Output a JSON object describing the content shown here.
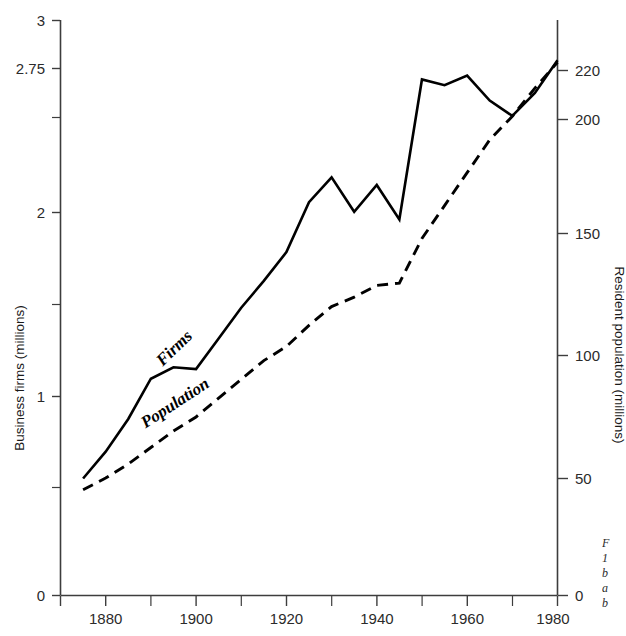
{
  "chart_data": {
    "type": "line",
    "title": "",
    "subtitle": "",
    "xlabel": "",
    "ylabel": "Business firms (millions)",
    "y2label": "Resident population (millions)",
    "grid": false,
    "legend_position": "inline-on-curve",
    "xlim": [
      1870,
      1980
    ],
    "ylim": [
      0,
      3
    ],
    "y2lim": [
      0,
      245
    ],
    "x_ticks_major": [
      1880,
      1900,
      1920,
      1940,
      1960,
      1980
    ],
    "x_ticks_minor": [
      1890,
      1910,
      1930,
      1950,
      1970
    ],
    "y_ticks_major": [
      0,
      1,
      2,
      2.75,
      3
    ],
    "y_tick_labels": [
      "0",
      "1",
      "2",
      "2.75",
      "3"
    ],
    "y_ticks_minor": [
      0.5,
      1.5
    ],
    "y2_ticks": [
      0,
      50,
      100,
      150,
      200,
      220
    ],
    "y2_tick_labels": [
      "0",
      "50",
      "100",
      "150",
      "200",
      "220"
    ],
    "x": [
      1875,
      1880,
      1885,
      1890,
      1895,
      1900,
      1905,
      1910,
      1915,
      1920,
      1925,
      1930,
      1935,
      1940,
      1945,
      1950,
      1955,
      1960,
      1965,
      1970,
      1975,
      1980
    ],
    "series": [
      {
        "name": "Firms",
        "axis": "left",
        "style": "solid",
        "units": "millions of business firms",
        "values": [
          0.61,
          0.75,
          0.92,
          1.13,
          1.19,
          1.18,
          1.34,
          1.5,
          1.64,
          1.79,
          2.05,
          2.18,
          2.0,
          2.14,
          1.96,
          2.69,
          2.66,
          2.71,
          2.58,
          2.5,
          2.62,
          2.79
        ]
      },
      {
        "name": "Population",
        "axis": "right",
        "style": "dashed",
        "units": "millions of residents",
        "values": [
          45,
          50,
          56,
          63,
          70,
          76,
          84,
          92,
          100,
          106,
          115,
          123,
          127,
          132,
          133,
          152,
          166,
          180,
          194,
          204,
          216,
          227
        ]
      }
    ],
    "series_inline_labels": [
      {
        "text": "Firms",
        "x": 1896,
        "y": 1.27,
        "rotation": -44
      },
      {
        "text": "Population",
        "x": 1896,
        "y": 0.98,
        "rotation": -33
      }
    ],
    "caption_fragment": [
      "F",
      "1",
      "b",
      "a",
      "b"
    ]
  }
}
